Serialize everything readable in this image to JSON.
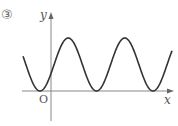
{
  "problem_number": "③",
  "axes": {
    "x_label": "x",
    "y_label": "y",
    "origin_label": "O"
  },
  "curve": {
    "description": "periodic wave (shifted cosine-like) with minima touching x-axis",
    "color": "#333333",
    "peaks_x_px": [
      70,
      126
    ],
    "minima_x_px": [
      40,
      97,
      153
    ]
  }
}
